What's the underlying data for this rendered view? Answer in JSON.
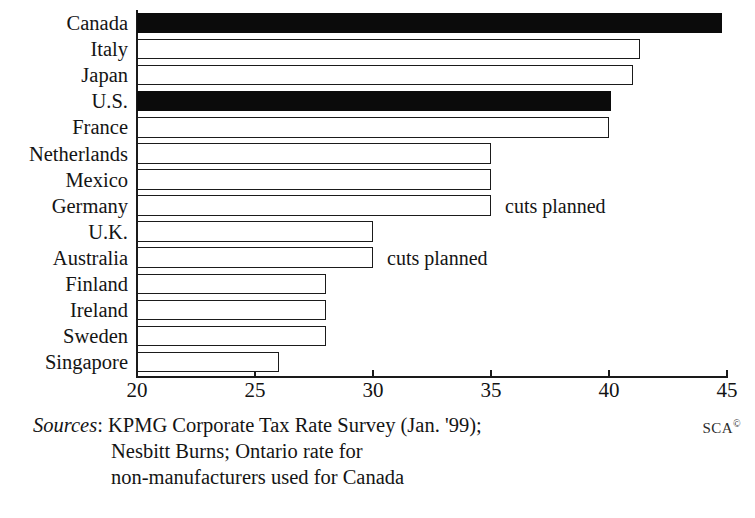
{
  "chart_data": {
    "type": "bar",
    "orientation": "horizontal",
    "title": "",
    "xlabel": "",
    "ylabel": "",
    "xlim": [
      20,
      45
    ],
    "xticks": [
      20,
      25,
      30,
      35,
      40,
      45
    ],
    "xtick_labels": [
      "20",
      "25",
      "30",
      "35",
      "40",
      "45"
    ],
    "grid": false,
    "legend": "none",
    "categories": [
      "Canada",
      "Italy",
      "Japan",
      "U.S.",
      "France",
      "Netherlands",
      "Mexico",
      "Germany",
      "U.K.",
      "Australia",
      "Finland",
      "Ireland",
      "Sweden",
      "Singapore"
    ],
    "values": [
      44.8,
      41.3,
      41.0,
      40.1,
      40.0,
      35.0,
      35.0,
      35.0,
      30.0,
      30.0,
      28.0,
      28.0,
      28.0,
      26.0
    ],
    "bars": [
      {
        "label": "Canada",
        "value": 44.8,
        "fill": "solid",
        "note": ""
      },
      {
        "label": "Italy",
        "value": 41.3,
        "fill": "open",
        "note": ""
      },
      {
        "label": "Japan",
        "value": 41.0,
        "fill": "open",
        "note": ""
      },
      {
        "label": "U.S.",
        "value": 40.1,
        "fill": "solid",
        "note": ""
      },
      {
        "label": "France",
        "value": 40.0,
        "fill": "open",
        "note": ""
      },
      {
        "label": "Netherlands",
        "value": 35.0,
        "fill": "open",
        "note": ""
      },
      {
        "label": "Mexico",
        "value": 35.0,
        "fill": "open",
        "note": ""
      },
      {
        "label": "Germany",
        "value": 35.0,
        "fill": "open",
        "note": "cuts planned"
      },
      {
        "label": "U.K.",
        "value": 30.0,
        "fill": "open",
        "note": ""
      },
      {
        "label": "Australia",
        "value": 30.0,
        "fill": "open",
        "note": "cuts planned"
      },
      {
        "label": "Finland",
        "value": 28.0,
        "fill": "open",
        "note": ""
      },
      {
        "label": "Ireland",
        "value": 28.0,
        "fill": "open",
        "note": ""
      },
      {
        "label": "Sweden",
        "value": 28.0,
        "fill": "open",
        "note": ""
      },
      {
        "label": "Singapore",
        "value": 26.0,
        "fill": "open",
        "note": ""
      }
    ],
    "annotations": [
      "cuts planned",
      "cuts planned"
    ],
    "colors": {
      "solid_bar": "#0b0b0b",
      "open_bar_fill": "#ffffff",
      "bar_outline": "#1b1b1b",
      "axis": "#1a1a1a",
      "text": "#141414",
      "background": "#ffffff"
    }
  },
  "footer": {
    "sources_label": "Sources",
    "sources_colon": ":",
    "line1": "KPMG Corporate Tax Rate Survey (Jan. '99);",
    "line2": "Nesbitt Burns; Ontario rate for",
    "line3": "non-manufacturers used for Canada",
    "credit": "SCA",
    "credit_mark": "©"
  }
}
